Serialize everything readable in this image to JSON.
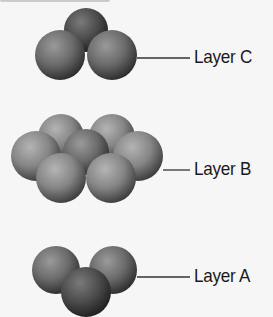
{
  "diagram": {
    "type": "close-packed sphere layers",
    "colors": {
      "background": "#f6f6f6",
      "sphere_light": "#8a8a8a",
      "sphere_dark": "#4a4a4a",
      "leader_line": "#333333",
      "label_text": "#1a1a1a"
    },
    "layers": [
      {
        "id": "C",
        "label": "Layer C",
        "sphere_count": 3
      },
      {
        "id": "B",
        "label": "Layer B",
        "sphere_count": 7
      },
      {
        "id": "A",
        "label": "Layer A",
        "sphere_count": 3
      }
    ]
  }
}
